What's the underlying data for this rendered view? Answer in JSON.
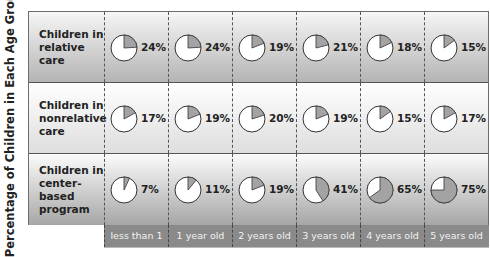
{
  "chart_data": {
    "type": "table",
    "subtype": "pie-grid",
    "title": "",
    "ylabel": "Percentage of Children in Each Age Group*",
    "xlabel": "",
    "categories": [
      "less than 1",
      "1 year old",
      "2 years old",
      "3 years old",
      "4 years old",
      "5 years old"
    ],
    "series": [
      {
        "name": "Children in relative care",
        "values": [
          24,
          24,
          19,
          21,
          18,
          15
        ]
      },
      {
        "name": "Children in nonrelative care",
        "values": [
          17,
          19,
          20,
          19,
          15,
          17
        ]
      },
      {
        "name": "Children in center-based program",
        "values": [
          7,
          11,
          19,
          41,
          65,
          75
        ]
      }
    ],
    "unit": "%",
    "colors": {
      "filled": "#a3a3a3",
      "empty": "#ffffff",
      "outline": "#333333"
    }
  },
  "ylabel": "Percentage of Children in Each Age Group*",
  "rows": [
    {
      "label_lines": [
        "Children in",
        "relative care"
      ],
      "pct": [
        "24%",
        "24%",
        "19%",
        "21%",
        "18%",
        "15%"
      ]
    },
    {
      "label_lines": [
        "Children in",
        "nonrelative",
        "care"
      ],
      "pct": [
        "17%",
        "19%",
        "20%",
        "19%",
        "15%",
        "17%"
      ]
    },
    {
      "label_lines": [
        "Children in",
        "center-based",
        "program"
      ],
      "pct": [
        "7%",
        "11%",
        "19%",
        "41%",
        "65%",
        "75%"
      ]
    }
  ],
  "columns": [
    "less than 1",
    "1 year old",
    "2 years old",
    "3 years old",
    "4 years old",
    "5 years old"
  ]
}
